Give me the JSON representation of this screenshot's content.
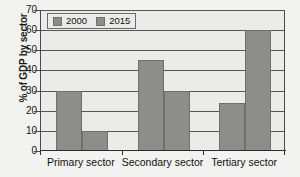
{
  "chart_data": {
    "type": "bar",
    "title": "",
    "subtitle": "",
    "xlabel": "",
    "ylabel": "% of GDP by sector",
    "categories": [
      "Primary sector",
      "Secondary sector",
      "Tertiary sector"
    ],
    "series": [
      {
        "name": "2000",
        "values": [
          30,
          45,
          24
        ],
        "color": "#8d8d8b"
      },
      {
        "name": "2015",
        "values": [
          10,
          30,
          60
        ],
        "color": "#8d8d8b"
      }
    ],
    "ylim": [
      0,
      70
    ],
    "ytick_values": [
      0,
      10,
      20,
      30,
      40,
      50,
      60,
      70
    ],
    "ytick_labels": [
      "0",
      "10",
      "20",
      "30",
      "40",
      "50",
      "60",
      "70"
    ],
    "grid": true,
    "grid_axis": "y",
    "legend_position": "top-left-inside",
    "legend_entries": [
      "2000",
      "2015"
    ],
    "annotations": []
  },
  "colors": {
    "bar_fill": "#8d8d8b",
    "bar_edge": "#6f6f6d",
    "plot_background": "#ebebe9",
    "figure_background": "#f2f2f0",
    "gridline": "#555553",
    "axis_line": "#2e2e2c",
    "text": "#111111"
  }
}
